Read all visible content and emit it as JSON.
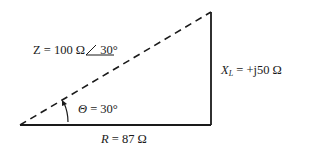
{
  "diagram": {
    "type": "impedance-triangle",
    "hypotenuse": {
      "symbol": "Z",
      "label_prefix": "Z = 100 Ω",
      "angle_symbol": "∠",
      "angle_value": "30°",
      "style": "dashed"
    },
    "vertical": {
      "symbol": "X",
      "subscript": "L",
      "value": " = +j50 Ω"
    },
    "base": {
      "symbol": "R",
      "value": " = 87 Ω"
    },
    "angle": {
      "symbol": "Θ",
      "value": " = 30°"
    },
    "line_color": "#1a1a1a"
  }
}
